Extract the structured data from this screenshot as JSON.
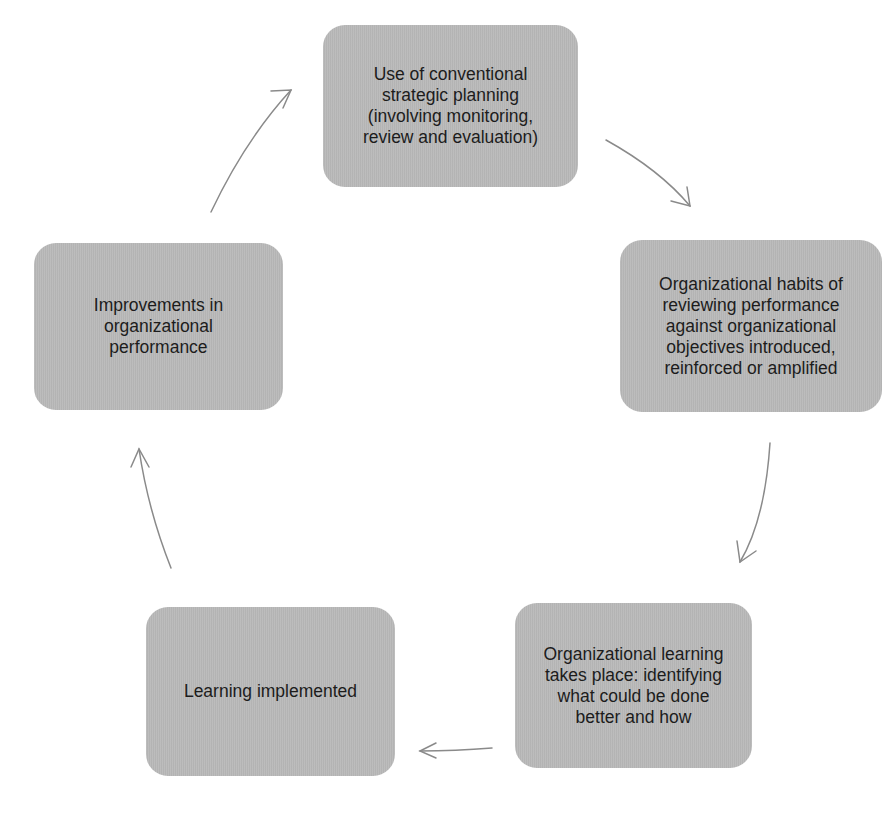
{
  "diagram": {
    "type": "cycle",
    "box_color": "#b9b9b9",
    "arrow_color": "#8a8a8a",
    "nodes": [
      {
        "id": "planning",
        "label": "Use of conventional\nstrategic planning\n(involving monitoring,\nreview and evaluation)"
      },
      {
        "id": "habits",
        "label": "Organizational habits of\nreviewing performance\nagainst organizational\nobjectives introduced,\nreinforced or amplified"
      },
      {
        "id": "learning",
        "label": "Organizational learning\ntakes place: identifying\nwhat could be done\nbetter and how"
      },
      {
        "id": "implemented",
        "label": "Learning implemented"
      },
      {
        "id": "improvements",
        "label": "Improvements in\norganizational\nperformance"
      }
    ],
    "edges": [
      {
        "from": "planning",
        "to": "habits"
      },
      {
        "from": "habits",
        "to": "learning"
      },
      {
        "from": "learning",
        "to": "implemented"
      },
      {
        "from": "implemented",
        "to": "improvements"
      },
      {
        "from": "improvements",
        "to": "planning"
      }
    ]
  }
}
